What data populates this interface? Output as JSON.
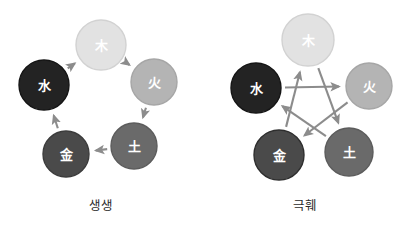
{
  "figure": {
    "background_color": "#ffffff",
    "width": 407,
    "height": 244
  },
  "panels": [
    {
      "id": "sheng",
      "caption": "생생",
      "cycle_type": "generating",
      "arrow_color": "#8c8c8c",
      "nodes": [
        {
          "id": "wood",
          "glyph": "木",
          "cx": 101,
          "cy": 45,
          "r": 25,
          "fill": "#e2e2e2",
          "stroke": "#d2d2d2",
          "text_color": "#ffffff"
        },
        {
          "id": "fire",
          "glyph": "火",
          "cx": 154,
          "cy": 82,
          "r": 23,
          "fill": "#b4b4b4",
          "stroke": "#a6a6a6",
          "text_color": "#ffffff"
        },
        {
          "id": "earth",
          "glyph": "土",
          "cx": 134,
          "cy": 146,
          "r": 23,
          "fill": "#6a6a6a",
          "stroke": "#5c5c5c",
          "text_color": "#ffffff"
        },
        {
          "id": "metal",
          "glyph": "金",
          "cx": 66,
          "cy": 154,
          "r": 23,
          "fill": "#4a4a4a",
          "stroke": "#3c3c3c",
          "text_color": "#ffffff"
        },
        {
          "id": "water",
          "glyph": "水",
          "cx": 44,
          "cy": 85,
          "r": 25,
          "fill": "#232323",
          "stroke": "#151515",
          "text_color": "#ffffff"
        }
      ],
      "arrows": [
        {
          "from": "water",
          "to": "wood"
        },
        {
          "from": "wood",
          "to": "fire"
        },
        {
          "from": "fire",
          "to": "earth"
        },
        {
          "from": "earth",
          "to": "metal"
        },
        {
          "from": "metal",
          "to": "water"
        }
      ]
    },
    {
      "id": "ke",
      "caption": "극훼",
      "cycle_type": "overcoming",
      "arrow_color": "#8c8c8c",
      "nodes": [
        {
          "id": "wood",
          "glyph": "木",
          "cx": 104,
          "cy": 40,
          "r": 26,
          "fill": "#e2e2e2",
          "stroke": "#d2d2d2",
          "text_color": "#ffffff"
        },
        {
          "id": "fire",
          "glyph": "火",
          "cx": 165,
          "cy": 86,
          "r": 23,
          "fill": "#b4b4b4",
          "stroke": "#a6a6a6",
          "text_color": "#ffffff"
        },
        {
          "id": "earth",
          "glyph": "土",
          "cx": 145,
          "cy": 152,
          "r": 24,
          "fill": "#6a6a6a",
          "stroke": "#5c5c5c",
          "text_color": "#ffffff"
        },
        {
          "id": "metal",
          "glyph": "金",
          "cx": 75,
          "cy": 155,
          "r": 25,
          "fill": "#4a4a4a",
          "stroke": "#2e2e2e",
          "text_color": "#ffffff"
        },
        {
          "id": "water",
          "glyph": "水",
          "cx": 52,
          "cy": 88,
          "r": 25,
          "fill": "#232323",
          "stroke": "#151515",
          "text_color": "#ffffff"
        }
      ],
      "arrows": [
        {
          "from": "wood",
          "to": "earth"
        },
        {
          "from": "earth",
          "to": "water"
        },
        {
          "from": "water",
          "to": "fire"
        },
        {
          "from": "fire",
          "to": "metal"
        },
        {
          "from": "metal",
          "to": "wood"
        }
      ]
    }
  ]
}
